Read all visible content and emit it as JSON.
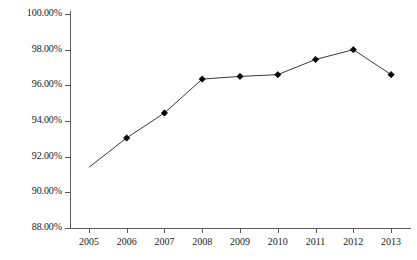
{
  "chart_data": {
    "type": "line",
    "title": "",
    "subtitle": "",
    "xlabel": "",
    "ylabel": "",
    "categories": [
      "2005",
      "2006",
      "2007",
      "2008",
      "2009",
      "2010",
      "2011",
      "2012",
      "2013"
    ],
    "values": [
      91.4,
      93.05,
      94.45,
      96.35,
      96.5,
      96.6,
      97.45,
      98.0,
      96.6
    ],
    "value_labels": [
      "91.40%",
      "93.05%",
      "94.45%",
      "96.35%",
      "96.50%",
      "96.60%",
      "97.45%",
      "98.00%",
      "96.60%"
    ],
    "series": [
      {
        "name": "",
        "values": [
          91.4,
          93.05,
          94.45,
          96.35,
          96.5,
          96.6,
          97.45,
          98.0,
          96.6
        ]
      }
    ],
    "ylim": [
      88.0,
      100.0
    ],
    "ytick_values": [
      88.0,
      90.0,
      92.0,
      94.0,
      96.0,
      98.0,
      100.0
    ],
    "ytick_labels": [
      "88.00%",
      "90.00%",
      "92.00%",
      "94.00%",
      "96.00%",
      "98.00%",
      "100.00%"
    ],
    "xtick_labels": [
      "2005",
      "2006",
      "2007",
      "2008",
      "2009",
      "2010",
      "2011",
      "2012",
      "2013"
    ],
    "grid": false,
    "legend": "none",
    "marker": "diamond",
    "marker_visible_from_index": 1,
    "line_color": "#3a3a3a",
    "marker_color": "#000000",
    "axis_color": "#5c5c5c",
    "background_color": "#ffffff",
    "annotations": []
  }
}
